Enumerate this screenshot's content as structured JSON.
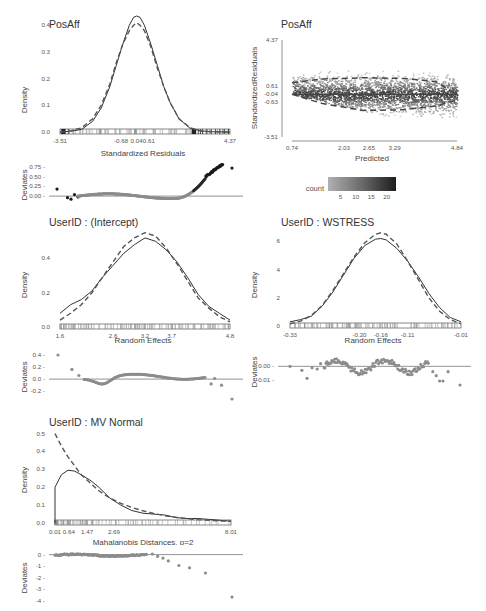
{
  "chart_data": [
    {
      "id": "posaff_resid_density",
      "type": "line",
      "title": "PosAff",
      "xlabel": "Standardized Residuals",
      "ylabel": "Density",
      "xlim": [
        -3.51,
        4.37
      ],
      "ylim": [
        0,
        0.45
      ],
      "xticks": [
        "-3.51",
        "-0.68",
        "0.04",
        "0.61",
        "4.37"
      ],
      "xtick_values": [
        -3.51,
        -0.68,
        0.04,
        0.61,
        4.37
      ],
      "yticks": [
        "0.0",
        "0.1",
        "0.2",
        "0.3",
        "0.4"
      ],
      "ytick_values": [
        0,
        0.1,
        0.2,
        0.3,
        0.4
      ],
      "series": [
        {
          "name": "Empirical density",
          "style": "solid",
          "x": [
            -3.51,
            -3.0,
            -2.5,
            -2.0,
            -1.6,
            -1.2,
            -0.9,
            -0.6,
            -0.3,
            -0.1,
            0.04,
            0.2,
            0.4,
            0.7,
            1.0,
            1.3,
            1.6,
            2.0,
            2.5,
            3.0,
            3.5,
            4.37
          ],
          "y": [
            0.0,
            0.003,
            0.01,
            0.04,
            0.09,
            0.17,
            0.25,
            0.33,
            0.4,
            0.43,
            0.435,
            0.43,
            0.4,
            0.33,
            0.25,
            0.17,
            0.11,
            0.05,
            0.015,
            0.004,
            0.001,
            0.0
          ]
        },
        {
          "name": "Normal reference",
          "style": "dashed",
          "x": [
            -3.51,
            -3.0,
            -2.5,
            -2.0,
            -1.6,
            -1.2,
            -0.9,
            -0.6,
            -0.3,
            -0.1,
            0.04,
            0.2,
            0.4,
            0.7,
            1.0,
            1.3,
            1.6,
            2.0,
            2.5,
            3.0,
            3.5,
            4.37
          ],
          "y": [
            0.0,
            0.004,
            0.016,
            0.05,
            0.1,
            0.18,
            0.26,
            0.33,
            0.38,
            0.4,
            0.41,
            0.4,
            0.38,
            0.32,
            0.24,
            0.17,
            0.11,
            0.05,
            0.017,
            0.004,
            0.001,
            0.0
          ]
        }
      ],
      "rug": true
    },
    {
      "id": "posaff_resid_vs_pred",
      "type": "heatmap",
      "title": "PosAff",
      "xlabel": "Predicted",
      "ylabel": "StandardizedResiduals",
      "xlim": [
        0.74,
        4.84
      ],
      "ylim": [
        -3.51,
        4.37
      ],
      "xticks": [
        "0.74",
        "2.03",
        "2.65",
        "3.29",
        "4.84"
      ],
      "xtick_values": [
        0.74,
        2.03,
        2.65,
        3.29,
        4.84
      ],
      "yticks": [
        "-3.51",
        "-0.63",
        "-0.04",
        "0.61",
        "4.37"
      ],
      "ytick_values": [
        -3.51,
        -0.63,
        -0.04,
        0.61,
        4.37
      ],
      "legend": {
        "title": "count",
        "ticks": [
          "5",
          "10",
          "15",
          "20"
        ],
        "tick_values": [
          5,
          10,
          15,
          20
        ],
        "range": [
          1,
          23
        ],
        "position": "bottom"
      },
      "lines": [
        {
          "name": "median",
          "style": "solid",
          "x": [
            0.74,
            4.84
          ],
          "y": [
            -0.04,
            -0.04
          ]
        },
        {
          "name": "upper quantile",
          "style": "dashed",
          "x": [
            0.74,
            1.5,
            2.5,
            3.5,
            4.3,
            4.84
          ],
          "y": [
            0.9,
            1.2,
            1.3,
            1.25,
            1.0,
            -0.04
          ]
        },
        {
          "name": "lower quantile",
          "style": "dashed",
          "x": [
            0.74,
            1.5,
            2.5,
            3.5,
            4.3,
            4.84
          ],
          "y": [
            -0.04,
            -0.8,
            -1.35,
            -1.3,
            -1.0,
            -0.5
          ]
        }
      ]
    },
    {
      "id": "posaff_resid_deviates",
      "type": "scatter",
      "ylabel": "Deviates",
      "ylim": [
        -0.1,
        0.85
      ],
      "yticks": [
        "0.00",
        "0.25",
        "0.50",
        "0.75"
      ],
      "ytick_values": [
        0,
        0.25,
        0.5,
        0.75
      ],
      "reference_line": 0
    },
    {
      "id": "intercept_density",
      "type": "line",
      "title": "UserID : (Intercept)",
      "xlabel": "Random Effects",
      "ylabel": "Density",
      "xlim": [
        1.6,
        4.8
      ],
      "ylim": [
        0,
        0.56
      ],
      "xticks": [
        "1.6",
        "2.6",
        "3.2",
        "3.7",
        "4.8"
      ],
      "xtick_values": [
        1.6,
        2.6,
        3.2,
        3.7,
        4.8
      ],
      "yticks": [
        "0.0",
        "0.2",
        "0.4"
      ],
      "ytick_values": [
        0,
        0.2,
        0.4
      ],
      "series": [
        {
          "name": "Empirical density",
          "style": "solid",
          "x": [
            1.6,
            1.8,
            2.0,
            2.2,
            2.4,
            2.6,
            2.8,
            3.0,
            3.2,
            3.4,
            3.6,
            3.8,
            4.0,
            4.2,
            4.4,
            4.6,
            4.8
          ],
          "y": [
            0.08,
            0.13,
            0.16,
            0.21,
            0.29,
            0.36,
            0.43,
            0.48,
            0.52,
            0.5,
            0.45,
            0.38,
            0.29,
            0.19,
            0.12,
            0.08,
            0.04
          ]
        },
        {
          "name": "Normal reference",
          "style": "dashed",
          "x": [
            1.6,
            1.8,
            2.0,
            2.2,
            2.4,
            2.6,
            2.8,
            3.0,
            3.2,
            3.4,
            3.6,
            3.8,
            4.0,
            4.2,
            4.4,
            4.6,
            4.8
          ],
          "y": [
            0.04,
            0.08,
            0.13,
            0.2,
            0.29,
            0.38,
            0.47,
            0.52,
            0.55,
            0.53,
            0.46,
            0.37,
            0.27,
            0.17,
            0.11,
            0.06,
            0.03
          ]
        }
      ],
      "rug": true
    },
    {
      "id": "intercept_deviates",
      "type": "scatter",
      "ylabel": "Deviates",
      "ylim": [
        -0.38,
        0.45
      ],
      "yticks": [
        "-0.2",
        "0.0",
        "0.2",
        "0.4"
      ],
      "ytick_values": [
        -0.2,
        0,
        0.2,
        0.4
      ],
      "reference_line": 0
    },
    {
      "id": "wstress_density",
      "type": "line",
      "title": "UserID : WSTRESS",
      "xlabel": "Random Effects",
      "ylabel": "Density",
      "xlim": [
        -0.33,
        -0.01
      ],
      "ylim": [
        0,
        6.8
      ],
      "xticks": [
        "-0.33",
        "-0.20",
        "-0.16",
        "-0.11",
        "-0.01"
      ],
      "xtick_values": [
        -0.33,
        -0.2,
        -0.16,
        -0.11,
        -0.01
      ],
      "yticks": [
        "0",
        "2",
        "4",
        "6"
      ],
      "ytick_values": [
        0,
        2,
        4,
        6
      ],
      "series": [
        {
          "name": "Empirical density",
          "style": "solid",
          "x": [
            -0.33,
            -0.31,
            -0.29,
            -0.27,
            -0.25,
            -0.23,
            -0.21,
            -0.19,
            -0.17,
            -0.16,
            -0.15,
            -0.13,
            -0.11,
            -0.09,
            -0.07,
            -0.05,
            -0.03,
            -0.01
          ],
          "y": [
            0.3,
            0.45,
            0.7,
            1.4,
            2.4,
            3.6,
            4.8,
            5.7,
            6.15,
            6.2,
            6.1,
            5.5,
            4.6,
            3.5,
            2.3,
            1.3,
            0.6,
            0.3
          ]
        },
        {
          "name": "Normal reference",
          "style": "dashed",
          "x": [
            -0.33,
            -0.31,
            -0.29,
            -0.27,
            -0.25,
            -0.23,
            -0.21,
            -0.19,
            -0.17,
            -0.16,
            -0.15,
            -0.13,
            -0.11,
            -0.09,
            -0.07,
            -0.05,
            -0.03,
            -0.01
          ],
          "y": [
            0.15,
            0.35,
            0.75,
            1.45,
            2.5,
            3.7,
            4.9,
            5.9,
            6.5,
            6.6,
            6.5,
            5.8,
            4.6,
            3.3,
            2.0,
            1.05,
            0.45,
            0.15
          ]
        }
      ],
      "rug": true
    },
    {
      "id": "wstress_deviates",
      "type": "scatter",
      "ylabel": "Deviates",
      "ylim": [
        -0.02,
        0.01
      ],
      "yticks": [
        "-0.01",
        "0.00"
      ],
      "ytick_values": [
        -0.01,
        0
      ],
      "reference_line": 0
    },
    {
      "id": "mvnormal_density",
      "type": "line",
      "title": "UserID : MV Normal",
      "xlabel": "Mahalanobis Distances, p=2",
      "ylabel": "Density",
      "xlim": [
        0.01,
        8.01
      ],
      "ylim": [
        0,
        0.52
      ],
      "xticks": [
        "0.01",
        "0.64",
        "1.47",
        "2.69",
        "8.01"
      ],
      "xtick_values": [
        0.01,
        0.64,
        1.47,
        2.69,
        8.01
      ],
      "yticks": [
        "0.0",
        "0.1",
        "0.2",
        "0.3",
        "0.4",
        "0.5"
      ],
      "ytick_values": [
        0,
        0.1,
        0.2,
        0.3,
        0.4,
        0.5
      ],
      "series": [
        {
          "name": "Empirical density",
          "style": "solid",
          "x": [
            0.01,
            0.01,
            0.3,
            0.6,
            0.9,
            1.2,
            1.6,
            2.0,
            2.5,
            3.0,
            3.5,
            4.0,
            4.5,
            5.0,
            5.5,
            6.0,
            6.5,
            7.0,
            7.5,
            8.01
          ],
          "y": [
            0.0,
            0.2,
            0.27,
            0.295,
            0.29,
            0.27,
            0.24,
            0.2,
            0.14,
            0.1,
            0.07,
            0.055,
            0.05,
            0.045,
            0.03,
            0.025,
            0.025,
            0.02,
            0.015,
            0.01
          ]
        },
        {
          "name": "Chi-square reference",
          "style": "dashed",
          "x": [
            0.01,
            0.3,
            0.6,
            0.9,
            1.2,
            1.6,
            2.0,
            2.5,
            3.0,
            3.5,
            4.0,
            4.5,
            5.0,
            5.5,
            6.0,
            6.5,
            7.0,
            7.5,
            8.01
          ],
          "y": [
            0.5,
            0.43,
            0.37,
            0.32,
            0.27,
            0.225,
            0.18,
            0.14,
            0.11,
            0.087,
            0.068,
            0.053,
            0.041,
            0.032,
            0.025,
            0.019,
            0.015,
            0.012,
            0.009
          ]
        }
      ],
      "rug": true
    },
    {
      "id": "mvnormal_deviates",
      "type": "scatter",
      "ylabel": "Deviates",
      "ylim": [
        -4.3,
        0.4
      ],
      "yticks": [
        "-4",
        "-3",
        "-2",
        "-1",
        "0"
      ],
      "ytick_values": [
        -4,
        -3,
        -2,
        -1,
        0
      ],
      "reference_line": 0
    }
  ],
  "colors": {
    "line": "#333333",
    "dashed": "#555555",
    "points_light": "#8c8c8c",
    "points_dark": "#1a1a1a",
    "axis": "#666666",
    "gradient_low": "#aaaaaa",
    "gradient_high": "#1a1a1a"
  }
}
